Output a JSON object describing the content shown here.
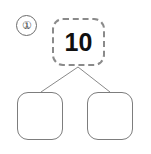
{
  "worksheet": {
    "item_number": "①",
    "background_color": "#ffffff",
    "stroke_color": "#7d7d7d",
    "dashed_stroke_color": "#8a8a8a",
    "text_color": "#101010"
  },
  "number_bond": {
    "total": {
      "label": "10",
      "style": "dashed",
      "name": "whole"
    },
    "parts": [
      {
        "label": "",
        "style": "solid",
        "name": "part-left"
      },
      {
        "label": "",
        "style": "solid",
        "name": "part-right"
      }
    ],
    "connectors": [
      {
        "from": "total",
        "to": "part-left"
      },
      {
        "from": "total",
        "to": "part-right"
      }
    ]
  }
}
